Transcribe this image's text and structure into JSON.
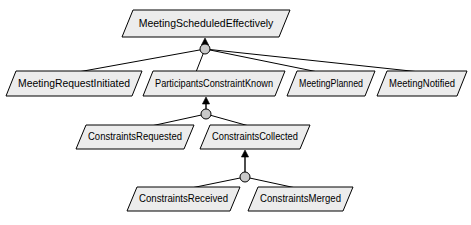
{
  "diagram": {
    "type": "goal-model",
    "notation": "KAOS goal refinement diagram",
    "background_color": "#ffffff",
    "goal_fill_color": "#ececec",
    "goal_stroke_color": "#000000",
    "refinement_node_color": "#c9c9c9",
    "goals": [
      {
        "id": "g-meeting-scheduled-effectively",
        "label": "MeetingScheduledEffectively",
        "level": 0,
        "x": 122,
        "y": 10,
        "width": 168,
        "height": 27,
        "skew": 11
      },
      {
        "id": "g-meeting-request-initiated",
        "label": "MeetingRequestInitiated",
        "level": 1,
        "x": 6,
        "y": 71,
        "width": 136,
        "height": 25,
        "skew": 10
      },
      {
        "id": "g-participants-constraint-known",
        "label": "ParticipantsConstraintKnown",
        "level": 1,
        "x": 143,
        "y": 71,
        "width": 142,
        "height": 25,
        "skew": 10
      },
      {
        "id": "g-meeting-planned",
        "label": "MeetingPlanned",
        "level": 1,
        "x": 287,
        "y": 71,
        "width": 88,
        "height": 25,
        "skew": 10
      },
      {
        "id": "g-meeting-notified",
        "label": "MeetingNotified",
        "level": 1,
        "x": 377,
        "y": 71,
        "width": 90,
        "height": 25,
        "skew": 10
      },
      {
        "id": "g-constraints-requested",
        "label": "ConstraintsRequested",
        "level": 2,
        "x": 76,
        "y": 125,
        "width": 118,
        "height": 24,
        "skew": 10
      },
      {
        "id": "g-constraints-collected",
        "label": "ConstraintsCollected",
        "level": 2,
        "x": 200,
        "y": 125,
        "width": 110,
        "height": 24,
        "skew": 10
      },
      {
        "id": "g-constraints-received",
        "label": "ConstraintsReceived",
        "level": 3,
        "x": 127,
        "y": 187,
        "width": 113,
        "height": 24,
        "skew": 10
      },
      {
        "id": "g-constraints-merged",
        "label": "ConstraintsMerged",
        "level": 3,
        "x": 248,
        "y": 187,
        "width": 105,
        "height": 24,
        "skew": 10
      }
    ],
    "refinements": [
      {
        "id": "r-top",
        "parent": "g-meeting-scheduled-effectively",
        "node_x": 205,
        "node_y": 49,
        "node_r": 5,
        "arrow_to_y": 38,
        "children": [
          {
            "id": "g-meeting-request-initiated",
            "x": 78,
            "y": 71
          },
          {
            "id": "g-participants-constraint-known",
            "x": 196,
            "y": 71
          },
          {
            "id": "g-meeting-planned",
            "x": 318,
            "y": 71
          },
          {
            "id": "g-meeting-notified",
            "x": 420,
            "y": 71
          }
        ]
      },
      {
        "id": "r-participants",
        "parent": "g-participants-constraint-known",
        "node_x": 206,
        "node_y": 114,
        "node_r": 5,
        "arrow_to_y": 97,
        "children": [
          {
            "id": "g-constraints-requested",
            "x": 151,
            "y": 125
          },
          {
            "id": "g-constraints-collected",
            "x": 249,
            "y": 125
          }
        ]
      },
      {
        "id": "r-collected",
        "parent": "g-constraints-collected",
        "node_x": 245,
        "node_y": 177,
        "node_r": 5,
        "arrow_to_y": 150,
        "children": [
          {
            "id": "g-constraints-received",
            "x": 191,
            "y": 187
          },
          {
            "id": "g-constraints-merged",
            "x": 296,
            "y": 187
          }
        ]
      }
    ]
  }
}
